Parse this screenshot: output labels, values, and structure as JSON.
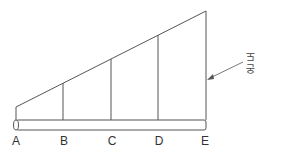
{
  "diagram": {
    "points": [
      {
        "label": "A",
        "x": 16,
        "top": 107
      },
      {
        "label": "B",
        "x": 63,
        "top": 83
      },
      {
        "label": "C",
        "x": 111,
        "top": 59
      },
      {
        "label": "D",
        "x": 158,
        "top": 35
      },
      {
        "label": "E",
        "x": 206,
        "top": 11
      }
    ],
    "annotation": "온도",
    "line_color": "#444444"
  }
}
